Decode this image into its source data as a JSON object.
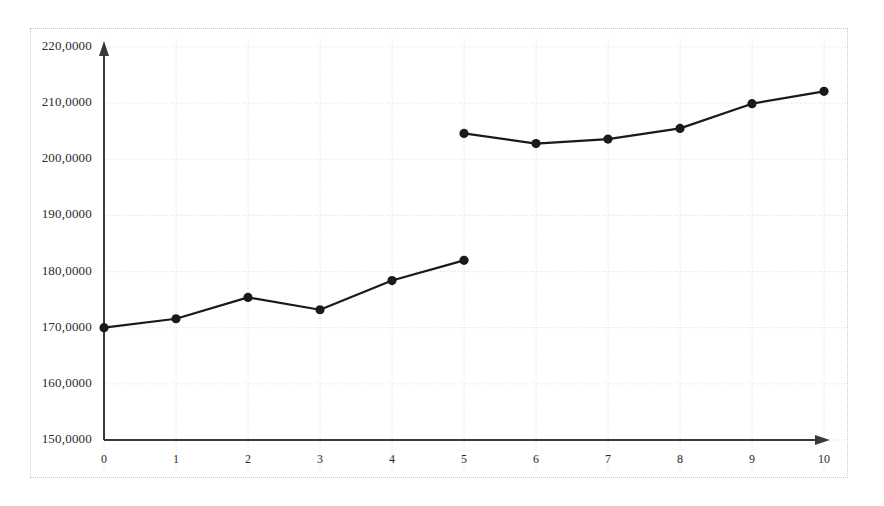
{
  "chart_data": {
    "type": "line",
    "title": "",
    "subtitle": "",
    "xlabel": "",
    "ylabel": "",
    "xlim": [
      0,
      10
    ],
    "ylim": [
      150,
      220
    ],
    "grid": true,
    "legend": false,
    "legend_position": "none",
    "x_ticks": [
      "0",
      "1",
      "2",
      "3",
      "4",
      "5",
      "6",
      "7",
      "8",
      "9",
      "10"
    ],
    "y_ticks": [
      "150,0000",
      "160,0000",
      "170,0000",
      "180,0000",
      "190,0000",
      "200,0000",
      "210,0000",
      "220,0000"
    ],
    "y_tick_values": [
      150,
      160,
      170,
      180,
      190,
      200,
      210,
      220
    ],
    "decimal_separator": ",",
    "series": [
      {
        "name": "series-1",
        "color": "#1a1a1a",
        "marker": "circle",
        "x": [
          0,
          1,
          2,
          3,
          4,
          5
        ],
        "values": [
          170.0,
          171.6,
          175.4,
          173.2,
          178.4,
          182.0
        ]
      },
      {
        "name": "series-2",
        "color": "#1a1a1a",
        "marker": "circle",
        "x": [
          5,
          6,
          7,
          8,
          9,
          10
        ],
        "values": [
          204.6,
          202.8,
          203.6,
          205.5,
          209.9,
          212.1
        ]
      }
    ],
    "annotations": []
  },
  "axes": {
    "y_axis_name": "y-axis-arrow",
    "x_axis_name": "x-axis-arrow",
    "axis_color": "#3a3a3a",
    "grid_color": "#dcdcdc"
  }
}
